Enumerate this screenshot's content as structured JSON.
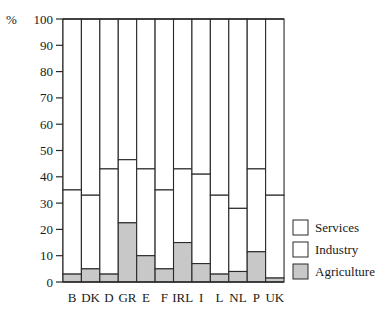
{
  "chart_data": {
    "type": "bar",
    "stacked": true,
    "title": "",
    "xlabel": "",
    "ylabel": "%",
    "ylim": [
      0,
      100
    ],
    "yticks": [
      0,
      10,
      20,
      30,
      40,
      50,
      60,
      70,
      80,
      90,
      100
    ],
    "grid": false,
    "legend_position": "right-bottom",
    "categories": [
      "B",
      "DK",
      "D",
      "GR",
      "E",
      "F",
      "IRL",
      "I",
      "L",
      "NL",
      "P",
      "UK"
    ],
    "series": [
      {
        "name": "Agriculture",
        "values": [
          3,
          5,
          3,
          22.5,
          10,
          5,
          15,
          7,
          3,
          4,
          11.5,
          1.5
        ],
        "color": "#c8c8c8"
      },
      {
        "name": "Industry",
        "values": [
          32,
          28,
          40,
          24,
          33,
          30,
          28,
          34,
          30,
          24,
          31.5,
          31.5
        ],
        "color": "#ffffff"
      },
      {
        "name": "Services",
        "values": [
          65,
          67,
          57,
          53.5,
          57,
          65,
          57,
          59,
          67,
          72,
          57,
          67
        ],
        "color": "#ffffff"
      }
    ],
    "cumulative_tops": {
      "agriculture": [
        3,
        5,
        3,
        22.5,
        10,
        5,
        15,
        7,
        3,
        4,
        11.5,
        1.5
      ],
      "industry": [
        35,
        33,
        43,
        46.5,
        43,
        35,
        43,
        41,
        33,
        28,
        43,
        33
      ]
    },
    "legend": [
      "Services",
      "Industry",
      "Agriculture"
    ]
  },
  "axis": {
    "y_unit_label": "%"
  }
}
